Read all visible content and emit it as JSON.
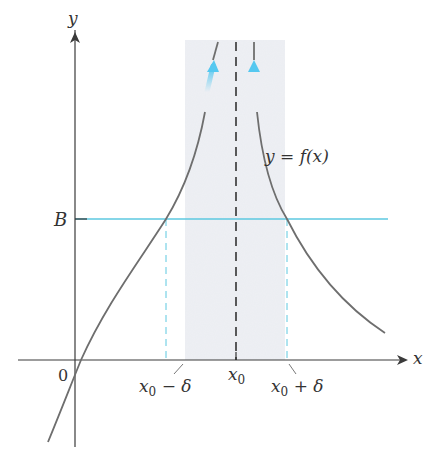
{
  "figure": {
    "labels": {
      "y_axis": "y",
      "x_axis": "x",
      "origin": "0",
      "B": "B",
      "function": "y = f(x)",
      "x0": "x",
      "x0_sub": "0",
      "x0_minus_delta_base": "x",
      "x0_minus_delta_sub": "0",
      "x0_minus_delta_tail": " − δ",
      "x0_plus_delta_base": "x",
      "x0_plus_delta_sub": "0",
      "x0_plus_delta_tail": " + δ"
    },
    "colors": {
      "axis": "#3a3a3a",
      "curve": "#6e6e6e",
      "guide": "#5cc8e0",
      "arrow": "#55c8f0",
      "shade": "#eef0f4",
      "asymptote": "#333333"
    }
  }
}
